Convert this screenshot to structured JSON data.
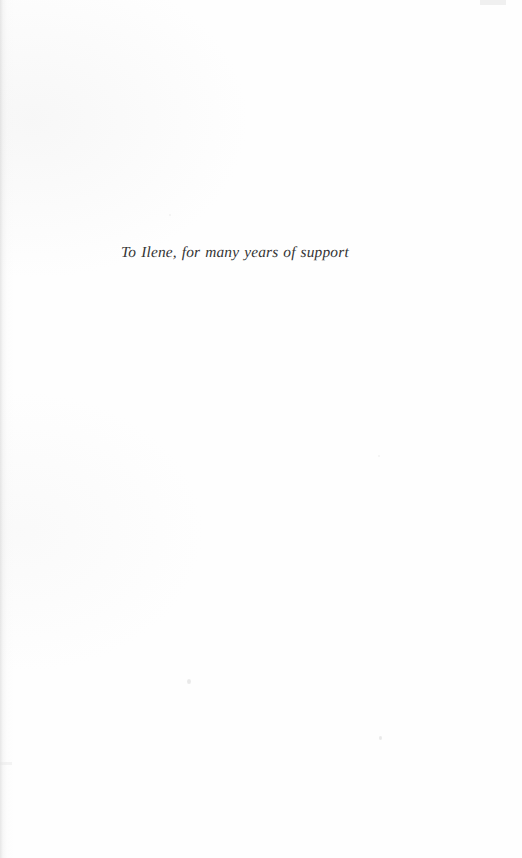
{
  "page": {
    "kind": "book-dedication-page",
    "width": 522,
    "height": 858,
    "background_color": "#fefefe",
    "text_color": "#343434"
  },
  "dedication": {
    "text": "To Ilene, for many years of support"
  }
}
